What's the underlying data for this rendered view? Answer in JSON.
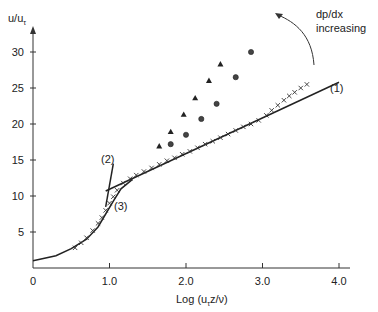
{
  "chart_data": {
    "type": "scatter",
    "title": "",
    "xlabel": "Log (u_τ z/ν)",
    "xlabel_main": "Log (u",
    "xlabel_sub": "τ",
    "xlabel_tail": "z/ν)",
    "ylabel": "u/u_τ",
    "ylabel_main": "u/u",
    "ylabel_sub": "τ",
    "xlim": [
      0,
      4.4
    ],
    "ylim": [
      0,
      32
    ],
    "x_ticks": [
      {
        "value": 0,
        "label": "0"
      },
      {
        "value": 1.0,
        "label": "1.0"
      },
      {
        "value": 2.0,
        "label": "2.0"
      },
      {
        "value": 3.0,
        "label": "3.0"
      },
      {
        "value": 4.0,
        "label": "4.0"
      }
    ],
    "y_ticks": [
      {
        "value": 5,
        "label": "5"
      },
      {
        "value": 10,
        "label": "10"
      },
      {
        "value": 15,
        "label": "15"
      },
      {
        "value": 20,
        "label": "20"
      },
      {
        "value": 25,
        "label": "25"
      },
      {
        "value": 30,
        "label": "30"
      }
    ],
    "grid": false,
    "lines": [
      {
        "name": "(1)",
        "description": "log law",
        "x": [
          0.95,
          4.0
        ],
        "y": [
          10.7,
          25.8
        ]
      },
      {
        "name": "(2)",
        "description": "linear sublayer (steep)",
        "x": [
          0.95,
          1.05
        ],
        "y": [
          8.5,
          14.5
        ]
      },
      {
        "name": "(3)",
        "description": "viscous/buffer curve",
        "x": [
          0,
          0.3,
          0.5,
          0.7,
          0.85,
          0.95,
          1.05,
          1.15,
          1.3
        ],
        "y": [
          1.0,
          1.7,
          2.7,
          4.0,
          5.7,
          7.5,
          9.3,
          11.0,
          12.3
        ]
      }
    ],
    "series": [
      {
        "name": "zero pressure gradient",
        "marker": "x",
        "x": [
          0.55,
          0.63,
          0.7,
          0.78,
          0.85,
          0.9,
          0.95,
          1.0,
          1.05,
          1.1,
          1.18,
          1.27,
          1.35,
          1.45,
          1.55,
          1.65,
          1.75,
          1.85,
          1.95,
          2.05,
          2.15,
          2.25,
          2.35,
          2.45,
          2.55,
          2.65,
          2.75,
          2.85,
          2.95,
          3.05,
          3.12,
          3.2,
          3.28,
          3.35,
          3.42,
          3.5,
          3.58
        ],
        "y": [
          2.8,
          3.5,
          4.2,
          5.2,
          6.2,
          7.0,
          8.0,
          9.0,
          9.9,
          10.8,
          11.8,
          12.4,
          12.9,
          13.4,
          13.9,
          14.4,
          14.9,
          15.3,
          15.8,
          16.2,
          16.7,
          17.2,
          17.6,
          18.1,
          18.6,
          19.1,
          19.6,
          20.0,
          20.5,
          21.2,
          21.9,
          22.6,
          23.3,
          23.9,
          24.4,
          25.0,
          25.5
        ]
      },
      {
        "name": "adverse gradient A",
        "marker": "circle",
        "x": [
          1.8,
          2.0,
          2.2,
          2.4,
          2.65,
          2.85
        ],
        "y": [
          17.2,
          18.5,
          20.7,
          22.8,
          26.5,
          30.0
        ]
      },
      {
        "name": "adverse gradient B",
        "marker": "triangle",
        "x": [
          1.65,
          1.8,
          1.97,
          2.12,
          2.3,
          2.45
        ],
        "y": [
          16.9,
          18.9,
          21.3,
          23.6,
          26.0,
          28.3
        ]
      }
    ],
    "annotations": [
      {
        "text": "(1)",
        "x": 4.1,
        "y": 26.5
      },
      {
        "text": "(2)",
        "x": 0.95,
        "y": 15.0
      },
      {
        "text": "(3)",
        "x": 1.15,
        "y": 9.0
      },
      {
        "text_line1": "dp/dx",
        "text_line2": "increasing",
        "description": "curved arrow pointing toward increasing pressure gradient"
      }
    ]
  },
  "labels": {
    "line1": "(1)",
    "line2": "(2)",
    "line3": "(3)",
    "arrow_line1": "dp/dx",
    "arrow_line2": "increasing"
  }
}
